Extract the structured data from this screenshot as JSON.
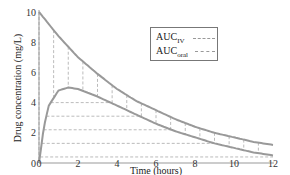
{
  "chart_data": {
    "type": "line",
    "title": "",
    "xlabel": "Time (hours)",
    "ylabel": "Drug concentration (mg/L)",
    "xlim": [
      0,
      12
    ],
    "ylim": [
      0,
      10
    ],
    "x_ticks": [
      0,
      2,
      4,
      6,
      8,
      10,
      12
    ],
    "y_ticks": [
      0,
      2,
      4,
      6,
      8,
      10
    ],
    "grid": false,
    "legend_position": "upper center",
    "series": [
      {
        "name": "AUC_IV",
        "x": [
          0,
          1,
          2,
          3,
          4,
          5,
          6,
          7,
          8,
          9,
          10,
          11,
          12
        ],
        "values": [
          10,
          8.4,
          7.0,
          5.9,
          4.9,
          4.1,
          3.5,
          2.9,
          2.4,
          2.0,
          1.7,
          1.4,
          1.2
        ],
        "area_fill": "vertical dashed lines"
      },
      {
        "name": "AUC_oral",
        "x": [
          0,
          0.25,
          0.5,
          1,
          1.5,
          2,
          3,
          4,
          5,
          6,
          7,
          8,
          9,
          10,
          11,
          12
        ],
        "values": [
          0,
          2.4,
          3.8,
          4.8,
          5.0,
          4.9,
          4.4,
          3.8,
          3.2,
          2.6,
          2.1,
          1.7,
          1.3,
          1.0,
          0.7,
          0.5
        ],
        "area_fill": "horizontal dashed lines"
      }
    ]
  },
  "legend": {
    "iv_label": "AUC",
    "iv_sub": "IV",
    "oral_label": "AUC",
    "oral_sub": "oral"
  },
  "axes": {
    "xlabel": "Time (hours)",
    "ylabel": "Drug concentration (mg/L)"
  },
  "colors": {
    "curve": "#999999",
    "hatch": "#aaaaaa",
    "axis": "#999999"
  }
}
